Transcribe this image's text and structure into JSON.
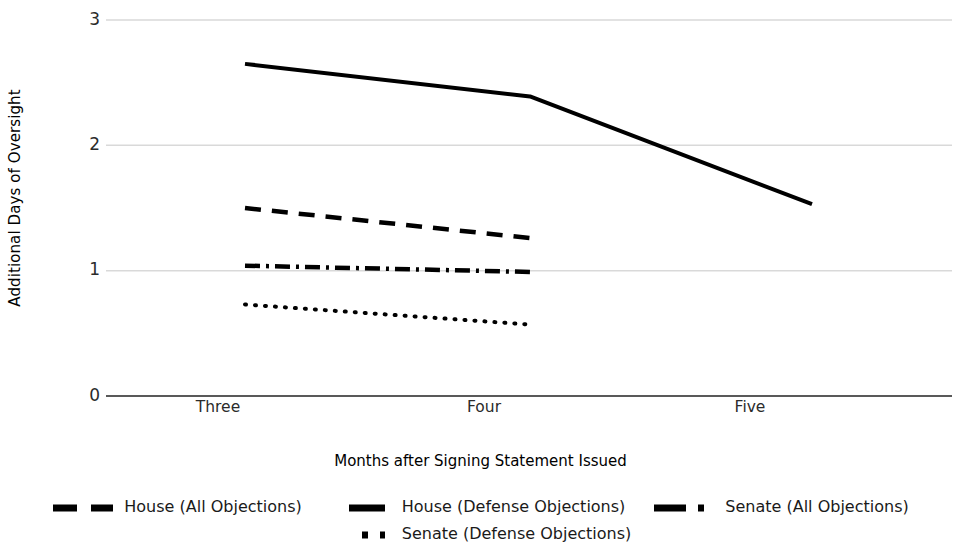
{
  "chart_data": {
    "type": "line",
    "title": "",
    "xlabel": "Months after Signing Statement Issued",
    "ylabel": "Additional Days of Oversight",
    "categories": [
      "Three",
      "Four",
      "Five"
    ],
    "x_tick_labels": [
      "Three",
      "Four",
      "Five"
    ],
    "y_tick_labels": [
      "0",
      "1",
      "2",
      "3"
    ],
    "y_ticks": [
      0,
      1,
      2,
      3
    ],
    "ylim": [
      0,
      3
    ],
    "grid": "horizontal",
    "legend_position": "bottom",
    "series": [
      {
        "name": "House (All Objections)",
        "style": "dashed",
        "color": "#000000",
        "x": [
          "Three",
          "Four"
        ],
        "values": [
          1.5,
          1.26
        ]
      },
      {
        "name": "House (Defense Objections)",
        "style": "solid",
        "color": "#000000",
        "x": [
          "Three",
          "Four",
          "Five"
        ],
        "values": [
          2.65,
          2.39,
          1.53
        ]
      },
      {
        "name": "Senate (All Objections)",
        "style": "dash-dot",
        "color": "#000000",
        "x": [
          "Three",
          "Four"
        ],
        "values": [
          1.04,
          0.99
        ]
      },
      {
        "name": "Senate (Defense Objections)",
        "style": "dotted",
        "color": "#000000",
        "x": [
          "Three",
          "Four"
        ],
        "values": [
          0.73,
          0.57
        ]
      }
    ]
  },
  "axes": {
    "y_title": "Additional Days of Oversight",
    "x_title": "Months after Signing Statement Issued",
    "y_labels": {
      "t3": "3",
      "t2": "2",
      "t1": "1",
      "t0": "0"
    },
    "x_labels": {
      "c0": "Three",
      "c1": "Four",
      "c2": "Five"
    }
  },
  "legend": {
    "row1": [
      {
        "label": "House (All Objections)",
        "style": "dashed"
      },
      {
        "label": "House (Defense Objections)",
        "style": "solid"
      },
      {
        "label": "Senate (All Objections)",
        "style": "dash-dot"
      }
    ],
    "row2": [
      {
        "label": "Senate (Defense Objections)",
        "style": "dotted"
      }
    ]
  },
  "colors": {
    "series": "#000000",
    "gridline": "#d9d9d9",
    "axis": "#595959",
    "text": "#1a1a1a",
    "background": "#ffffff"
  }
}
